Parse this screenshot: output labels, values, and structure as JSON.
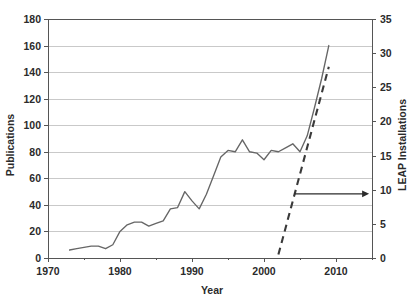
{
  "chart_data": {
    "type": "line",
    "title": "",
    "xlabel": "Year",
    "ylabel": "Publications",
    "y2label": "LEAP Installations",
    "xlim": [
      1970,
      2015
    ],
    "ylim": [
      0,
      180
    ],
    "y2lim": [
      0,
      35
    ],
    "xticks": [
      1970,
      1980,
      1990,
      2000,
      2010
    ],
    "xtick_labels": [
      "1970",
      "1980",
      "1990",
      "2000",
      "2010"
    ],
    "xminorticks": [
      1975,
      1985,
      1995,
      2005,
      2015
    ],
    "yticks": [
      0,
      20,
      40,
      60,
      80,
      100,
      120,
      140,
      160,
      180
    ],
    "ytick_labels": [
      "0",
      "20",
      "40",
      "60",
      "80",
      "100",
      "120",
      "140",
      "160",
      "180"
    ],
    "y2ticks": [
      0,
      5,
      10,
      15,
      20,
      25,
      30,
      35
    ],
    "y2tick_labels": [
      "0",
      "5",
      "10",
      "15",
      "20",
      "25",
      "30",
      "35"
    ],
    "grid": true,
    "grid_axis": "y",
    "legend": "none",
    "series": [
      {
        "name": "Publications",
        "axis": "left",
        "style": "solid",
        "color": "#666666",
        "x": [
          1973,
          1974,
          1975,
          1976,
          1977,
          1978,
          1979,
          1980,
          1981,
          1982,
          1983,
          1984,
          1985,
          1986,
          1987,
          1988,
          1989,
          1990,
          1991,
          1992,
          1993,
          1994,
          1995,
          1996,
          1997,
          1998,
          1999,
          2000,
          2001,
          2002,
          2003,
          2004,
          2005,
          2006,
          2007,
          2008,
          2009
        ],
        "values": [
          6,
          7,
          8,
          9,
          9,
          7,
          10,
          20,
          25,
          27,
          27,
          24,
          26,
          28,
          37,
          38,
          50,
          43,
          37,
          48,
          62,
          76,
          81,
          80,
          89,
          80,
          79,
          74,
          81,
          80,
          83,
          86,
          80,
          92,
          113,
          135,
          160
        ]
      },
      {
        "name": "LEAP Installations",
        "axis": "right",
        "style": "dashed",
        "color": "#3a3a3a",
        "x": [
          2002,
          2009
        ],
        "values": [
          0.5,
          28
        ]
      }
    ],
    "annotations": [
      {
        "type": "arrow",
        "name": "right-axis-pointer",
        "x_start": 2004.2,
        "x_end": 2014.6,
        "y_value": 9.4,
        "axis": "right",
        "direction": "right",
        "label": ""
      }
    ]
  }
}
